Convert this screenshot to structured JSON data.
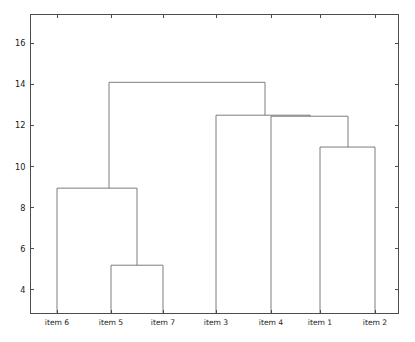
{
  "figure": {
    "title": "",
    "background_color": "#ffffff",
    "axis_color": "#4d4d4d",
    "link_color": "#6e6e6e",
    "width": 415,
    "height": 342
  },
  "chart_data": {
    "type": "line",
    "chart_kind": "dendrogram",
    "title": "",
    "xlabel": "",
    "ylabel": "",
    "grid": false,
    "legend": null,
    "ylim": [
      2.85,
      17.4
    ],
    "yticks": [
      4,
      6,
      8,
      10,
      12,
      14,
      16
    ],
    "ytick_labels": [
      "4",
      "6",
      "8",
      "10",
      "12",
      "14",
      "16"
    ],
    "leaf_order": [
      "item 6",
      "item 5",
      "item 7",
      "item 3",
      "item 4",
      "item 1",
      "item 2"
    ],
    "xtick_labels": [
      "item 6",
      "item 5",
      "item 7",
      "item 3",
      "item 4",
      "item 1",
      "item 2"
    ],
    "leaf_x": [
      57,
      111,
      163,
      216,
      271,
      320,
      375
    ],
    "merges": [
      {
        "id": "m1",
        "label": "item 5 + item 7",
        "left": "item 5",
        "right": "item 7",
        "height": 5.2,
        "x_center": 137
      },
      {
        "id": "m2",
        "label": "item 6 + (item 5, item 7)",
        "left": "item 6",
        "right": "m1",
        "height": 8.95,
        "x_center": 109
      },
      {
        "id": "m3",
        "label": "item 1 + item 2",
        "left": "item 1",
        "right": "item 2",
        "height": 10.95,
        "x_center": 348
      },
      {
        "id": "m4",
        "label": "item 4 + (item 1, item 2)",
        "left": "item 4",
        "right": "m3",
        "height": 12.45,
        "x_center": 310
      },
      {
        "id": "m5",
        "label": "item 3 + (item 4, item 1, item 2)",
        "left": "item 3",
        "right": "m4",
        "height": 12.5,
        "x_center": 265
      },
      {
        "id": "m6",
        "label": "root",
        "left": "m2",
        "right": "m5",
        "height": 14.1,
        "x_center": 187
      }
    ]
  }
}
